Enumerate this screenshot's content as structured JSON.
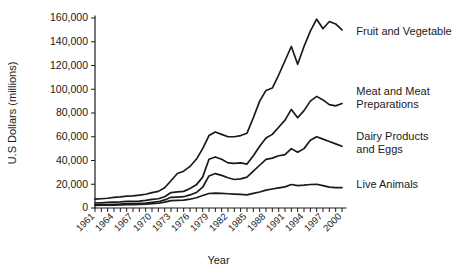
{
  "chart_data": {
    "type": "line",
    "title": "",
    "xlabel": "Year",
    "ylabel": "U.S Dollars (millions)",
    "xlim": [
      1961,
      2000
    ],
    "ylim": [
      0,
      160000
    ],
    "grid": false,
    "legend_position": "right-inline-labels",
    "ytick_labels": [
      "0",
      "20,000",
      "40,000",
      "60,000",
      "80,000",
      "100,000",
      "120,000",
      "140,000",
      "160,000"
    ],
    "ytick_values": [
      0,
      20000,
      40000,
      60000,
      80000,
      100000,
      120000,
      140000,
      160000
    ],
    "xtick_labels": [
      "1961",
      "1964",
      "1967",
      "1970",
      "1973",
      "1976",
      "1979",
      "1982",
      "1985",
      "1988",
      "1991",
      "1994",
      "1997",
      "2000"
    ],
    "xtick_values": [
      1961,
      1964,
      1967,
      1970,
      1973,
      1976,
      1979,
      1982,
      1985,
      1988,
      1991,
      1994,
      1997,
      2000
    ],
    "x": [
      1961,
      1962,
      1963,
      1964,
      1965,
      1966,
      1967,
      1968,
      1969,
      1970,
      1971,
      1972,
      1973,
      1974,
      1975,
      1976,
      1977,
      1978,
      1979,
      1980,
      1981,
      1982,
      1983,
      1984,
      1985,
      1986,
      1987,
      1988,
      1989,
      1990,
      1991,
      1992,
      1993,
      1994,
      1995,
      1996,
      1997,
      1998,
      1999,
      2000
    ],
    "series": [
      {
        "name": "Fruit and Vegetable",
        "label_x": 2001,
        "label_y": 148000,
        "values": [
          7500,
          7800,
          8200,
          9000,
          9400,
          10000,
          10200,
          10800,
          11600,
          13000,
          14000,
          17000,
          23000,
          29000,
          31000,
          35000,
          41000,
          50000,
          61000,
          64000,
          62000,
          60000,
          60000,
          61000,
          63000,
          76000,
          90000,
          99000,
          101000,
          112000,
          124000,
          136000,
          121000,
          136000,
          149000,
          159000,
          151000,
          157000,
          155000,
          150000
        ]
      },
      {
        "name": "Meat and Meat Preparations",
        "label_x": 2001,
        "label_y": 92000,
        "values": [
          4200,
          4400,
          4700,
          5000,
          5200,
          5600,
          5600,
          5800,
          6400,
          7200,
          7800,
          9500,
          13000,
          13500,
          14000,
          16500,
          19500,
          26000,
          41000,
          43000,
          41000,
          38000,
          37500,
          38000,
          37000,
          44000,
          52000,
          59000,
          62000,
          68000,
          74000,
          83000,
          76000,
          82000,
          90000,
          94000,
          91000,
          87000,
          86000,
          88000
        ]
      },
      {
        "name": "Dairy Products and Eggs",
        "label_x": 2001,
        "label_y": 54000,
        "values": [
          2600,
          2700,
          2900,
          3100,
          3300,
          3600,
          3700,
          3900,
          4200,
          4800,
          5300,
          6800,
          9000,
          9200,
          9500,
          11000,
          13000,
          17500,
          27000,
          29000,
          27500,
          25500,
          24000,
          24500,
          26000,
          31000,
          36000,
          41000,
          42000,
          44000,
          45000,
          50000,
          47000,
          50000,
          57000,
          60000,
          58000,
          56000,
          54000,
          52000
        ]
      },
      {
        "name": "Live Animals",
        "label_x": 2001,
        "label_y": 19000,
        "values": [
          2200,
          2300,
          2400,
          2500,
          2600,
          2800,
          2900,
          3000,
          3200,
          3600,
          4000,
          5000,
          6200,
          6400,
          6600,
          7400,
          8600,
          10500,
          12200,
          12500,
          12300,
          12000,
          11700,
          11500,
          11000,
          12300,
          13500,
          15000,
          16000,
          17000,
          17800,
          19800,
          18800,
          19200,
          19800,
          20000,
          18800,
          17600,
          17200,
          17200
        ]
      }
    ]
  }
}
